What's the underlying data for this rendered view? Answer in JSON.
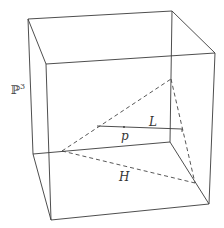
{
  "diagram": {
    "space_label": "ℙ",
    "space_exponent": "3",
    "line_label": "L",
    "point_label": "p",
    "plane_label": "H"
  }
}
